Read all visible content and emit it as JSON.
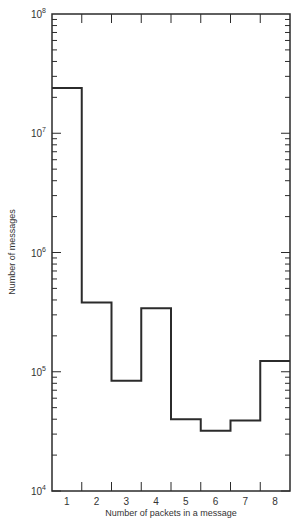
{
  "chart_data": {
    "type": "bar",
    "style": "step-histogram",
    "title": "",
    "xlabel": "Number of packets in a message",
    "ylabel": "Number of messages",
    "yscale": "log",
    "ylim": [
      10000,
      100000000
    ],
    "y_ticks": [
      {
        "base": "10",
        "exp": "4",
        "value": 10000
      },
      {
        "base": "10",
        "exp": "5",
        "value": 100000
      },
      {
        "base": "10",
        "exp": "6",
        "value": 1000000
      },
      {
        "base": "10",
        "exp": "7",
        "value": 10000000
      },
      {
        "base": "10",
        "exp": "8",
        "value": 100000000
      }
    ],
    "categories": [
      "1",
      "2",
      "3",
      "4",
      "5",
      "6",
      "7",
      "8"
    ],
    "values": [
      24000000,
      380000,
      84000,
      340000,
      40000,
      32000,
      39000,
      123000
    ],
    "grid": false,
    "legend": null,
    "line_color": "#2b2b2b"
  }
}
